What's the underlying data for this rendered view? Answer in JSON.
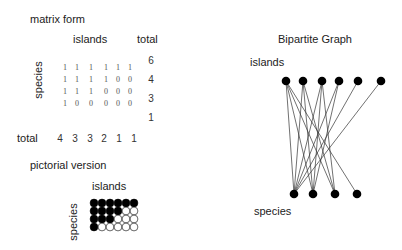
{
  "matrix_section": {
    "title": "matrix form",
    "column_label": "islands",
    "total_label": "total",
    "row_label": "species",
    "bottom_total_label": "total",
    "matrix": [
      [
        1,
        1,
        1,
        1,
        1,
        1
      ],
      [
        1,
        1,
        1,
        1,
        0,
        0
      ],
      [
        1,
        1,
        1,
        0,
        0,
        0
      ],
      [
        1,
        0,
        0,
        0,
        0,
        0
      ]
    ],
    "row_totals": [
      6,
      4,
      3,
      1
    ],
    "column_totals": [
      4,
      3,
      3,
      2,
      1,
      1
    ]
  },
  "pictorial_section": {
    "title": "pictorial version",
    "column_label": "islands",
    "row_label": "species",
    "filled_color": "#000000",
    "empty_color": "#ffffff"
  },
  "graph_section": {
    "title": "Bipartite Graph",
    "top_label": "islands",
    "bottom_label": "species",
    "island_nodes": 6,
    "species_nodes": 4
  }
}
